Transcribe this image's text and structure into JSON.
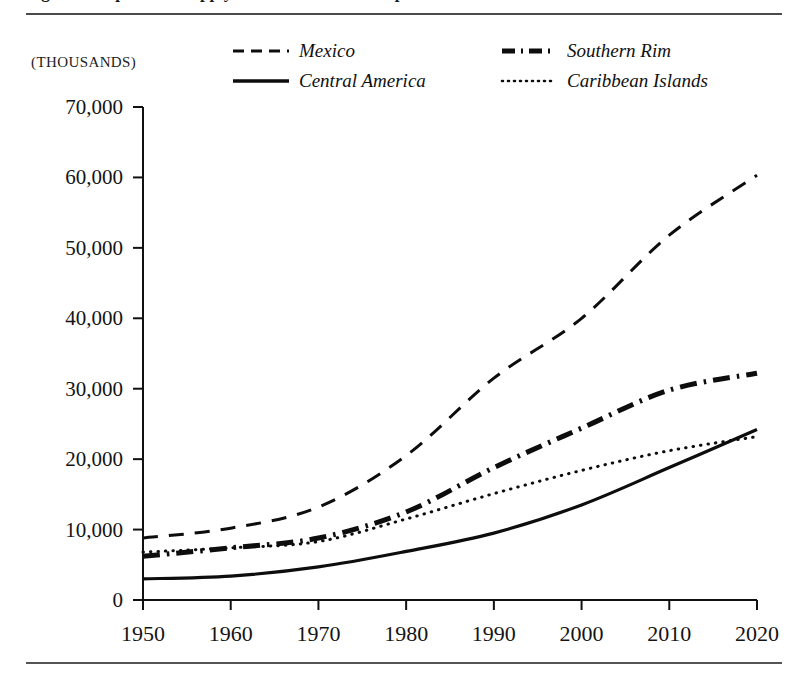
{
  "figure": {
    "caption": "Figure 1.  Population Supply of the Western Hemisphere, 1950-2020",
    "units_label": "(THOUSANDS)"
  },
  "legend": {
    "items": [
      {
        "label": "Mexico",
        "style": "dashed",
        "color": "#0d0d0d"
      },
      {
        "label": "Southern Rim",
        "style": "dash-dot",
        "color": "#0d0d0d"
      },
      {
        "label": "Central America",
        "style": "solid",
        "color": "#0d0d0d"
      },
      {
        "label": "Caribbean Islands",
        "style": "dotted",
        "color": "#0d0d0d"
      }
    ]
  },
  "chart_data": {
    "type": "line",
    "title": "",
    "xlabel": "",
    "ylabel": "(THOUSANDS)",
    "xlim": [
      1950,
      2020
    ],
    "ylim": [
      0,
      70000
    ],
    "xticks": [
      1950,
      1960,
      1970,
      1980,
      1990,
      2000,
      2010,
      2020
    ],
    "yticks": [
      0,
      10000,
      20000,
      30000,
      40000,
      50000,
      60000,
      70000
    ],
    "ytick_labels": [
      "0",
      "10,000",
      "20,000",
      "30,000",
      "40,000",
      "50,000",
      "60,000",
      "70,000"
    ],
    "xtick_labels": [
      "1950",
      "1960",
      "1970",
      "1980",
      "1990",
      "2000",
      "2010",
      "2020"
    ],
    "grid": false,
    "legend_position": "top",
    "x": [
      1950,
      1960,
      1970,
      1980,
      1990,
      2000,
      2010,
      2020
    ],
    "series": [
      {
        "name": "Mexico",
        "style": "dashed",
        "values": [
          8800,
          10200,
          13200,
          20500,
          31500,
          40000,
          51800,
          60300
        ]
      },
      {
        "name": "Southern Rim",
        "style": "dash-dot",
        "values": [
          6200,
          7400,
          8800,
          12500,
          18800,
          24400,
          29800,
          32200
        ]
      },
      {
        "name": "Central America",
        "style": "solid",
        "values": [
          3000,
          3400,
          4700,
          6900,
          9500,
          13500,
          18800,
          24200
        ]
      },
      {
        "name": "Caribbean Islands",
        "style": "dotted",
        "values": [
          6800,
          7400,
          8300,
          11500,
          15100,
          18400,
          21200,
          23200
        ]
      }
    ]
  }
}
